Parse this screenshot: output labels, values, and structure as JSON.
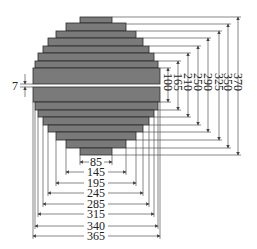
{
  "diagram": {
    "title": "",
    "colors": {
      "bar_fill": "#7a7a7a",
      "bar_stroke": "#2a2a2a",
      "line": "#555555",
      "text": "#222222"
    },
    "gap_label": "7",
    "vertical_dimensions": [
      "100",
      "165",
      "210",
      "250",
      "290",
      "325",
      "350",
      "370"
    ],
    "horizontal_dimensions": [
      "85",
      "145",
      "195",
      "245",
      "285",
      "315",
      "340",
      "365"
    ]
  }
}
